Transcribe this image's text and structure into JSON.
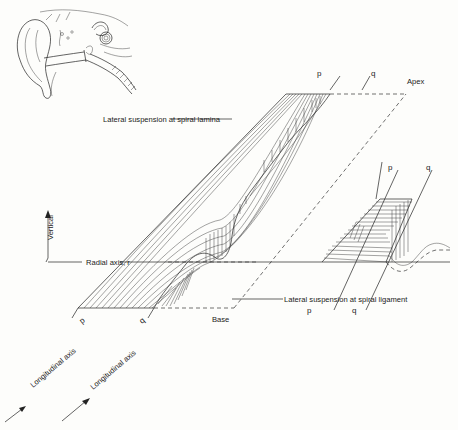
{
  "figure": {
    "inset": "ear-anatomy-sketch",
    "labels": {
      "apex": "Apex",
      "base": "Base",
      "lamina": "Lateral suspension at spiral lamina",
      "ligament": "Lateral suspension at spiral ligament",
      "radial": "Radial axis, r",
      "vertical": "Vertical",
      "long_p": "Longitudinal axis",
      "long_q": "Longitudinal axis",
      "p_top": "p",
      "q_top": "q",
      "p_right_top": "p",
      "q_right_top": "q",
      "p_right_bottom": "p",
      "q_right_bottom": "q",
      "p_axis": "p",
      "q_axis": "q"
    }
  }
}
